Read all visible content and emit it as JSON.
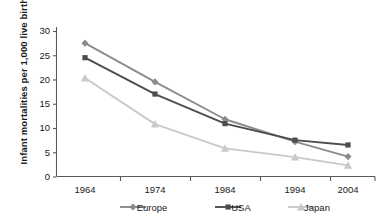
{
  "chart_data": {
    "type": "line",
    "title": "",
    "xlabel": "",
    "ylabel": "Infant mortalities per 1,000 live births",
    "categories": [
      "1964",
      "1974",
      "1984",
      "1994",
      "2004"
    ],
    "x_tick_labels": [
      "1964",
      "1974",
      "1984",
      "1994",
      "2004"
    ],
    "y_tick_labels": [
      "0",
      "5",
      "10",
      "15",
      "20",
      "25",
      "30"
    ],
    "y_ticks": [
      0,
      5,
      10,
      15,
      20,
      25,
      30
    ],
    "ylim": [
      0,
      30
    ],
    "grid": false,
    "legend_position": "bottom",
    "series": [
      {
        "name": "Europe",
        "marker": "diamond",
        "color": "#8c8c8c",
        "values": [
          27.5,
          19.5,
          11.8,
          7.2,
          4.1
        ]
      },
      {
        "name": "USA",
        "marker": "square",
        "color": "#4d4d4d",
        "values": [
          24.5,
          17.0,
          10.9,
          7.5,
          6.5
        ]
      },
      {
        "name": "Japan",
        "marker": "triangle",
        "color": "#c9c9c9",
        "values": [
          20.3,
          10.8,
          5.8,
          4.0,
          2.3
        ]
      }
    ]
  },
  "legend": {
    "items": [
      {
        "label": "Europe"
      },
      {
        "label": "USA"
      },
      {
        "label": "Japan"
      }
    ]
  },
  "colors": {
    "europe": "#8c8c8c",
    "usa": "#4d4d4d",
    "japan": "#c9c9c9",
    "axis": "#595959",
    "text": "#1a1a1a",
    "background": "#ffffff"
  }
}
